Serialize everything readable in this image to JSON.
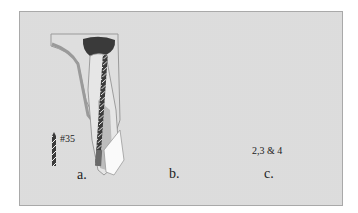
{
  "figure": {
    "type": "dental root canal instrumentation diagram",
    "colors": {
      "background": "#ececec",
      "frame_border": "#a9a9a9",
      "bone": "#dedede",
      "bone_outline": "#9a9a9a",
      "pulp_chamber": "#3a3a3a",
      "root_light": "#e6e6e6",
      "root_mid": "#bdbdbd",
      "root_dark": "#8c8c8c",
      "canal_fill": "#2e2e2e",
      "apex_white": "#fafafa"
    },
    "panels": [
      {
        "id": "a",
        "label": "a.",
        "instrument_label": "#35",
        "instrument": "twisted file"
      },
      {
        "id": "b",
        "label": "b.",
        "instrument_label": "",
        "instrument": "none (obturated canal)"
      },
      {
        "id": "c",
        "label": "c.",
        "instrument_label": "2,3 & 4",
        "instrument": "Gates Glidden drill"
      }
    ]
  }
}
